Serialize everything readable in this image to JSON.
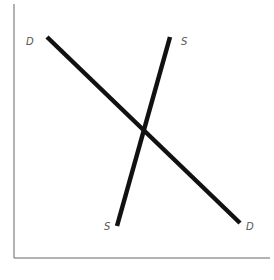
{
  "diagram": {
    "type": "supply-demand",
    "axes": {
      "y_axis": {
        "x": 14,
        "y1": 4,
        "y2": 258
      },
      "x_axis": {
        "y": 258,
        "x1": 14,
        "x2": 270
      }
    },
    "curves": [
      {
        "name": "demand",
        "label_start": "D",
        "label_end": "D",
        "x1": 46,
        "y1": 37,
        "x2": 240,
        "y2": 223
      },
      {
        "name": "supply",
        "label_start": "S",
        "label_end": "S",
        "x1": 170,
        "y1": 37,
        "x2": 117,
        "y2": 227
      }
    ],
    "labels": {
      "demand_top": "D",
      "demand_bottom": "D",
      "supply_top": "S",
      "supply_bottom": "S"
    }
  }
}
